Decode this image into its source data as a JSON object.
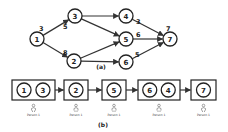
{
  "diagram_a": {
    "caption": "(a)",
    "nodes": [
      {
        "id": "1",
        "x": 37,
        "y": 39
      },
      {
        "id": "3",
        "x": 75,
        "y": 16
      },
      {
        "id": "2",
        "x": 74,
        "y": 61
      },
      {
        "id": "4",
        "x": 126,
        "y": 16
      },
      {
        "id": "5",
        "x": 126,
        "y": 39
      },
      {
        "id": "6",
        "x": 126,
        "y": 62
      },
      {
        "id": "7",
        "x": 170,
        "y": 39
      }
    ],
    "edges": [
      {
        "from": "1",
        "to": "3"
      },
      {
        "from": "1",
        "to": "2"
      },
      {
        "from": "3",
        "to": "4"
      },
      {
        "from": "3",
        "to": "5"
      },
      {
        "from": "2",
        "to": "5"
      },
      {
        "from": "2",
        "to": "6"
      },
      {
        "from": "4",
        "to": "7"
      },
      {
        "from": "5",
        "to": "7"
      },
      {
        "from": "6",
        "to": "7"
      }
    ],
    "weights": [
      {
        "label": "3",
        "x": 39,
        "y": 31
      },
      {
        "label": "5",
        "x": 63,
        "y": 29
      },
      {
        "label": "8",
        "x": 63,
        "y": 55
      },
      {
        "label": "3",
        "x": 136,
        "y": 24
      },
      {
        "label": "6",
        "x": 136,
        "y": 37
      },
      {
        "label": "5",
        "x": 135,
        "y": 57
      },
      {
        "label": "7",
        "x": 166,
        "y": 31
      }
    ]
  },
  "diagram_b": {
    "caption": "(b)",
    "groups": [
      {
        "nodes": [
          "1",
          "3"
        ],
        "x": 12,
        "w": 43,
        "person": "Person 1"
      },
      {
        "nodes": [
          "2"
        ],
        "x": 64,
        "w": 24,
        "person": "Person 1"
      },
      {
        "nodes": [
          "5"
        ],
        "x": 102,
        "w": 24,
        "person": "Person 1"
      },
      {
        "nodes": [
          "6",
          "4"
        ],
        "x": 138,
        "w": 42,
        "person": "Person 1"
      },
      {
        "nodes": [
          "7"
        ],
        "x": 191,
        "w": 25,
        "person": "Person 1"
      }
    ]
  }
}
